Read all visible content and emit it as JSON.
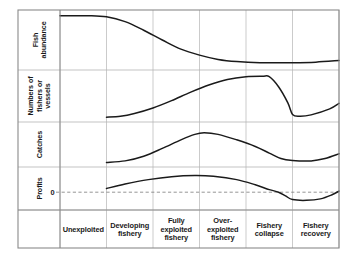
{
  "figure": {
    "background_color": "#ffffff",
    "border_color": "#8a8a8a",
    "grid_color": "#b4b4b4",
    "curve_color": "#1a1a1a",
    "zero_line_color": "#7a7a7a"
  },
  "axes": {
    "y_band_labels": [
      {
        "id": "fish-abundance",
        "lines": [
          "Fish",
          "abundance"
        ]
      },
      {
        "id": "fishers-vessels",
        "lines": [
          "Numbers of",
          "fishers or",
          "vessels"
        ]
      },
      {
        "id": "catches",
        "lines": [
          "Catches"
        ]
      },
      {
        "id": "profits",
        "lines": [
          "Profits"
        ]
      }
    ],
    "zero_tick": "0",
    "x_phase_labels": [
      {
        "id": "unexploited",
        "lines": [
          "Unexploited"
        ]
      },
      {
        "id": "developing-fishery",
        "lines": [
          "Developing",
          "fishery"
        ]
      },
      {
        "id": "fully-exploited-fishery",
        "lines": [
          "Fully",
          "exploited",
          "fishery"
        ]
      },
      {
        "id": "over-exploited-fishery",
        "lines": [
          "Over-",
          "exploited",
          "fishery"
        ]
      },
      {
        "id": "fishery-collapse",
        "lines": [
          "Fishery",
          "collapse"
        ]
      },
      {
        "id": "fishery-recovery",
        "lines": [
          "Fishery",
          "recovery"
        ]
      }
    ]
  },
  "chart_data": {
    "type": "line",
    "xlabel": "",
    "ylabel": "",
    "grid": true,
    "legend": "none",
    "x_categories": [
      "Unexploited",
      "Developing fishery",
      "Fully exploited fishery",
      "Over-exploited fishery",
      "Fishery collapse",
      "Fishery recovery"
    ],
    "x": [
      0,
      1,
      2,
      3,
      4,
      5,
      6
    ],
    "xlim": [
      0,
      6
    ],
    "panels": [
      {
        "name": "Fish abundance",
        "ylabel": "Fish abundance",
        "ylim": [
          0,
          100
        ],
        "y_axis_ticks": [],
        "series": [
          {
            "name": "Fish abundance",
            "points": [
              {
                "x": 0.0,
                "y": 95
              },
              {
                "x": 0.6,
                "y": 95
              },
              {
                "x": 1.0,
                "y": 93
              },
              {
                "x": 1.4,
                "y": 84
              },
              {
                "x": 1.8,
                "y": 68
              },
              {
                "x": 2.2,
                "y": 50
              },
              {
                "x": 2.6,
                "y": 33
              },
              {
                "x": 3.0,
                "y": 22
              },
              {
                "x": 3.4,
                "y": 14
              },
              {
                "x": 3.8,
                "y": 10
              },
              {
                "x": 4.3,
                "y": 8
              },
              {
                "x": 5.0,
                "y": 8
              },
              {
                "x": 5.5,
                "y": 9
              },
              {
                "x": 6.0,
                "y": 12
              }
            ]
          }
        ]
      },
      {
        "name": "Numbers of fishers or vessels",
        "ylabel": "Numbers of fishers or vessels",
        "ylim": [
          0,
          100
        ],
        "y_axis_ticks": [],
        "series": [
          {
            "name": "Numbers of fishers or vessels",
            "points": [
              {
                "x": 1.0,
                "y": 4
              },
              {
                "x": 1.3,
                "y": 6
              },
              {
                "x": 1.6,
                "y": 12
              },
              {
                "x": 2.0,
                "y": 24
              },
              {
                "x": 2.4,
                "y": 40
              },
              {
                "x": 2.8,
                "y": 58
              },
              {
                "x": 3.2,
                "y": 74
              },
              {
                "x": 3.6,
                "y": 86
              },
              {
                "x": 4.0,
                "y": 92
              },
              {
                "x": 4.35,
                "y": 93
              },
              {
                "x": 4.5,
                "y": 92
              },
              {
                "x": 4.7,
                "y": 70
              },
              {
                "x": 4.9,
                "y": 35
              },
              {
                "x": 5.0,
                "y": 10
              },
              {
                "x": 5.15,
                "y": 6
              },
              {
                "x": 5.4,
                "y": 9
              },
              {
                "x": 5.8,
                "y": 22
              },
              {
                "x": 6.0,
                "y": 34
              }
            ]
          }
        ]
      },
      {
        "name": "Catches",
        "ylabel": "Catches",
        "ylim": [
          0,
          100
        ],
        "y_axis_ticks": [],
        "series": [
          {
            "name": "Catches",
            "points": [
              {
                "x": 1.0,
                "y": 4
              },
              {
                "x": 1.4,
                "y": 8
              },
              {
                "x": 1.8,
                "y": 20
              },
              {
                "x": 2.2,
                "y": 40
              },
              {
                "x": 2.6,
                "y": 62
              },
              {
                "x": 2.9,
                "y": 76
              },
              {
                "x": 3.1,
                "y": 80
              },
              {
                "x": 3.4,
                "y": 76
              },
              {
                "x": 3.8,
                "y": 62
              },
              {
                "x": 4.2,
                "y": 45
              },
              {
                "x": 4.5,
                "y": 28
              },
              {
                "x": 4.75,
                "y": 14
              },
              {
                "x": 5.0,
                "y": 9
              },
              {
                "x": 5.4,
                "y": 8
              },
              {
                "x": 5.7,
                "y": 14
              },
              {
                "x": 6.0,
                "y": 26
              }
            ]
          }
        ]
      },
      {
        "name": "Profits",
        "ylabel": "Profits",
        "ylim": [
          -40,
          60
        ],
        "zero_line": 0,
        "y_axis_ticks": [
          {
            "value": 0,
            "label": "0"
          }
        ],
        "series": [
          {
            "name": "Profits",
            "points": [
              {
                "x": 1.0,
                "y": 10
              },
              {
                "x": 1.4,
                "y": 22
              },
              {
                "x": 1.9,
                "y": 34
              },
              {
                "x": 2.4,
                "y": 42
              },
              {
                "x": 2.9,
                "y": 45
              },
              {
                "x": 3.3,
                "y": 43
              },
              {
                "x": 3.8,
                "y": 34
              },
              {
                "x": 4.2,
                "y": 20
              },
              {
                "x": 4.5,
                "y": 7
              },
              {
                "x": 4.7,
                "y": 0
              },
              {
                "x": 4.85,
                "y": -10
              },
              {
                "x": 5.0,
                "y": -20
              },
              {
                "x": 5.3,
                "y": -22
              },
              {
                "x": 5.6,
                "y": -18
              },
              {
                "x": 5.85,
                "y": -7
              },
              {
                "x": 6.0,
                "y": 3
              }
            ]
          }
        ]
      }
    ]
  }
}
